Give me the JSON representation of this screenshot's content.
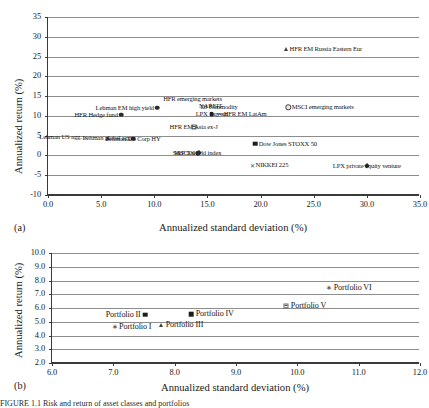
{
  "figure": {
    "caption_partial": "FIGURE 1.1  Risk and return of asset classes and portfolios"
  },
  "chart_data": [
    {
      "type": "scatter",
      "panel_tag": "(a)",
      "title": "",
      "xlabel": "Annualized standard deviation (%)",
      "ylabel": "Annualized return (%)",
      "xlim": [
        0.0,
        35.0
      ],
      "ylim": [
        -10,
        35
      ],
      "xticks": [
        "0.0",
        "5.0",
        "10.0",
        "15.0",
        "20.0",
        "25.0",
        "30.0",
        "35.0"
      ],
      "xtick_values": [
        0,
        5,
        10,
        15,
        20,
        25,
        30,
        35
      ],
      "yticks": [
        "-10",
        "-5",
        "0",
        "5",
        "10",
        "15",
        "20",
        "25",
        "30",
        "35"
      ],
      "ytick_values": [
        -10,
        -5,
        0,
        5,
        10,
        15,
        20,
        25,
        30,
        35
      ],
      "grid": true,
      "legend": "none",
      "points": [
        {
          "label": "HFR EM Russia Eastern Eur",
          "x": 22.4,
          "y": 26.9,
          "marker": "triangle",
          "label_pos": "right"
        },
        {
          "label": "HFR emerging markets",
          "x": 13.6,
          "y": 14.2,
          "marker": "none",
          "label_pos": "center"
        },
        {
          "label": "Lehman EM high yield",
          "x": 10.3,
          "y": 12.1,
          "marker": "circle",
          "label_pos": "left"
        },
        {
          "label": "NAREIT",
          "x": 15.3,
          "y": 12.4,
          "marker": "plus",
          "label_pos": "center"
        },
        {
          "label": "DJ commodity",
          "x": 16.1,
          "y": 12.3,
          "marker": "none",
          "label_pos": "center"
        },
        {
          "label": "MSCI emerging markets",
          "x": 22.6,
          "y": 12.2,
          "marker": "circle-ring",
          "label_pos": "right"
        },
        {
          "label": "HFR Hedge fund",
          "x": 6.9,
          "y": 10.3,
          "marker": "circle",
          "label_pos": "left"
        },
        {
          "label": "HFR EM LatAm",
          "x": 16.2,
          "y": 10.6,
          "marker": "dash",
          "label_pos": "right"
        },
        {
          "label": "LPX Buyout",
          "x": 15.4,
          "y": 10.4,
          "marker": "circle",
          "label_pos": "center"
        },
        {
          "label": "HFR EM Asia ex-J",
          "x": 13.7,
          "y": 7.2,
          "marker": "square-hatch",
          "label_pos": "center"
        },
        {
          "label": "Lehman US agg.",
          "x": 3.5,
          "y": 4.7,
          "marker": "x",
          "label_pos": "left"
        },
        {
          "label": "Lehman global agg.",
          "x": 5.6,
          "y": 4.5,
          "marker": "triangle",
          "label_pos": "center"
        },
        {
          "label": "Lehman US Corp HY",
          "x": 8.0,
          "y": 4.2,
          "marker": "circle",
          "label_pos": "center"
        },
        {
          "label": "MSCI world index",
          "x": 14.1,
          "y": 0.6,
          "marker": "circle",
          "label_pos": "center"
        },
        {
          "label": "S&P 500",
          "x": 14.2,
          "y": 0.6,
          "marker": "diamond",
          "label_pos": "left"
        },
        {
          "label": "Dow Jones STOXX 50",
          "x": 19.5,
          "y": 3.0,
          "marker": "square",
          "label_pos": "right"
        },
        {
          "label": "NIKKEI 225",
          "x": 19.2,
          "y": -2.4,
          "marker": "x",
          "label_pos": "right"
        },
        {
          "label": "LPX private equity venture",
          "x": 30.0,
          "y": -2.6,
          "marker": "diamond",
          "label_pos": "center"
        }
      ]
    },
    {
      "type": "scatter",
      "panel_tag": "(b)",
      "title": "",
      "xlabel": "Annualized standard deviation (%)",
      "ylabel": "Annualized return (%)",
      "xlim": [
        6.0,
        12.0
      ],
      "ylim": [
        2.0,
        10.0
      ],
      "xticks": [
        "6.0",
        "7.0",
        "8.0",
        "9.0",
        "10.0",
        "11.0",
        "12.0"
      ],
      "xtick_values": [
        6,
        7,
        8,
        9,
        10,
        11,
        12
      ],
      "yticks": [
        "2.0",
        "3.0",
        "4.0",
        "5.0",
        "6.0",
        "7.0",
        "8.0",
        "9.0",
        "10.0"
      ],
      "ytick_values": [
        2,
        3,
        4,
        5,
        6,
        7,
        8,
        9,
        10
      ],
      "grid": true,
      "legend": "none",
      "points": [
        {
          "label": "Portfolio I",
          "x": 7.02,
          "y": 4.62,
          "marker": "star",
          "label_pos": "right"
        },
        {
          "label": "Portfolio II",
          "x": 7.52,
          "y": 5.5,
          "marker": "square",
          "label_pos": "left"
        },
        {
          "label": "Portfolio III",
          "x": 7.78,
          "y": 4.78,
          "marker": "triangle",
          "label_pos": "right"
        },
        {
          "label": "Portfolio IV",
          "x": 8.27,
          "y": 5.55,
          "marker": "square",
          "label_pos": "right"
        },
        {
          "label": "Portfolio V",
          "x": 9.82,
          "y": 6.15,
          "marker": "square-hatch",
          "label_pos": "right"
        },
        {
          "label": "Portfolio VI",
          "x": 10.52,
          "y": 7.45,
          "marker": "star",
          "label_pos": "right"
        }
      ]
    }
  ]
}
